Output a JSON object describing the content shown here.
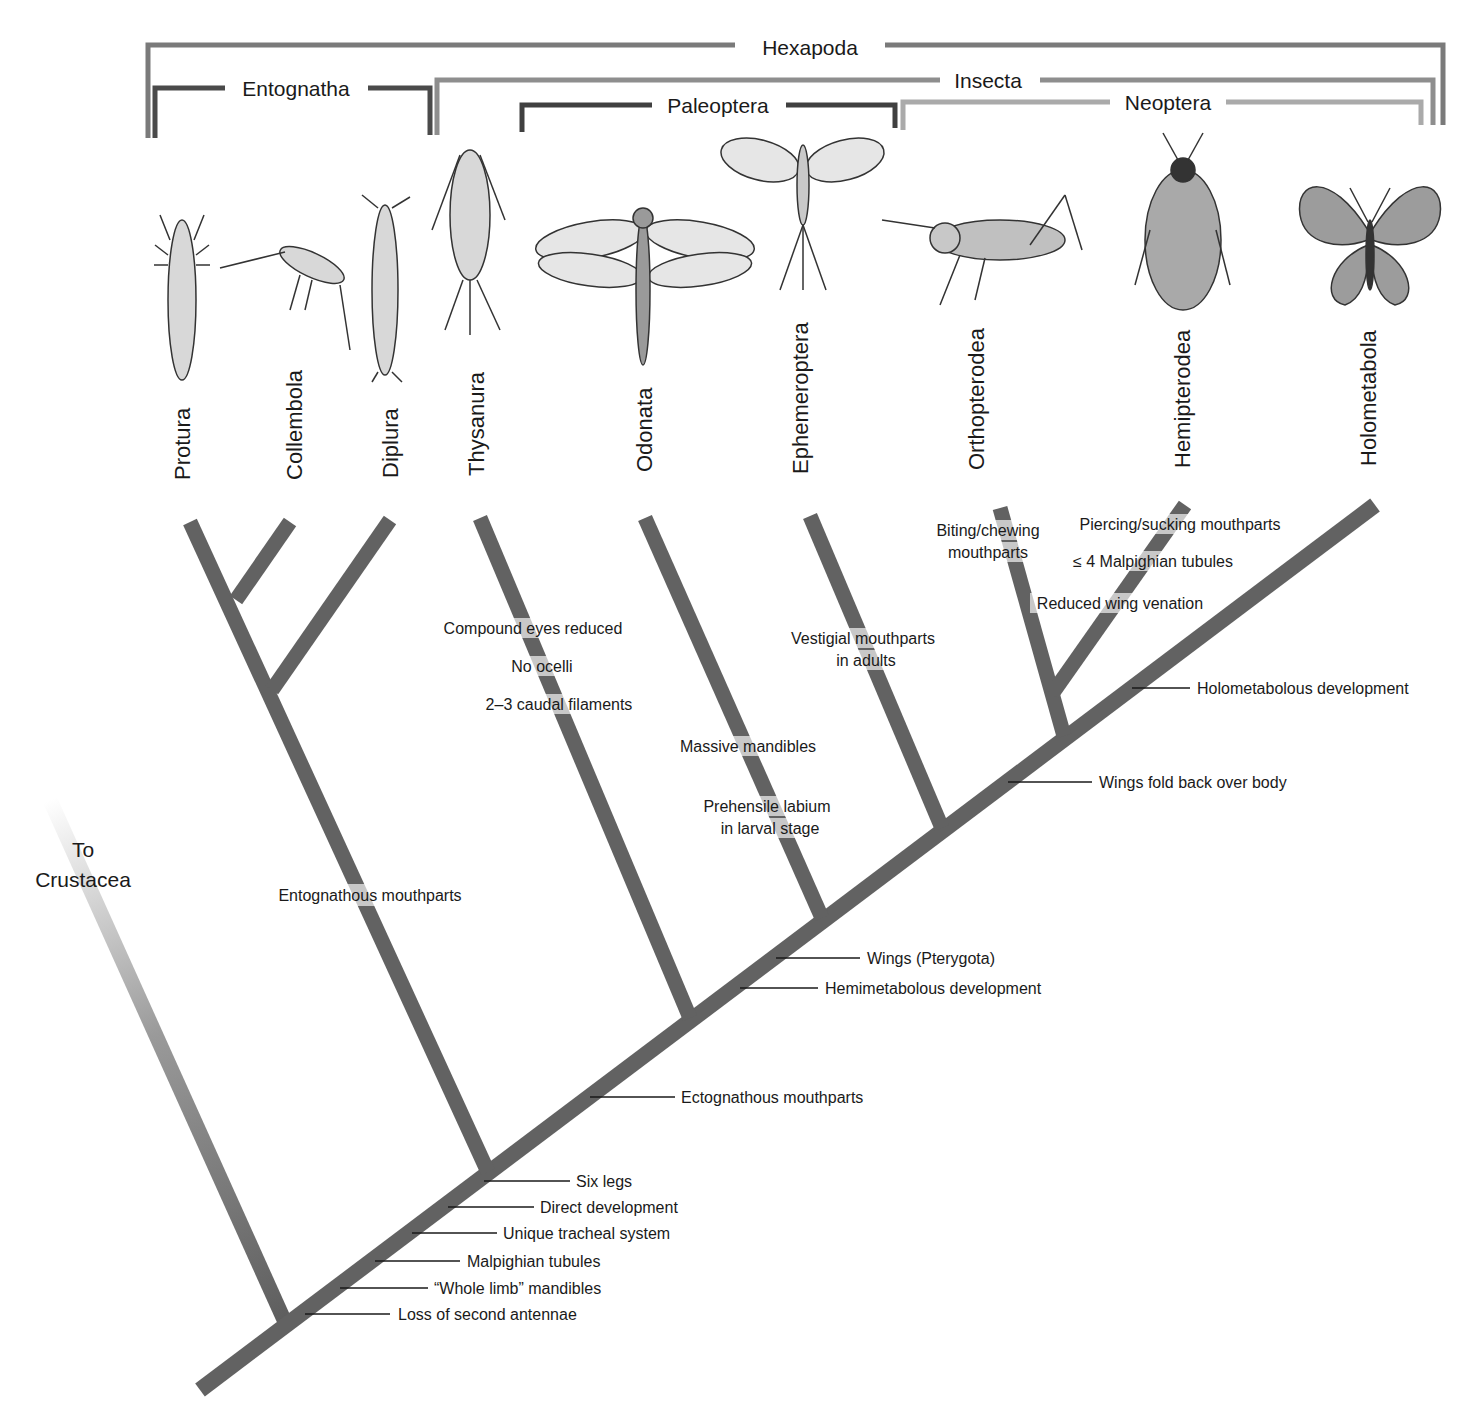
{
  "colors": {
    "branch": "#626262",
    "bracket_dark": "#4a4a4a",
    "bracket_mid": "#7a7a7a",
    "bracket_light": "#a8a8a8",
    "text": "#1a1a1a",
    "leader": "#1a1a1a"
  },
  "clades": {
    "hexapoda": "Hexapoda",
    "entognatha": "Entognatha",
    "insecta": "Insecta",
    "paleoptera": "Paleoptera",
    "neoptera": "Neoptera"
  },
  "taxa": [
    {
      "name": "Protura",
      "icon": "proturan-illustration"
    },
    {
      "name": "Collembola",
      "icon": "springtail-illustration"
    },
    {
      "name": "Diplura",
      "icon": "dipluran-illustration"
    },
    {
      "name": "Thysanura",
      "icon": "silverfish-illustration"
    },
    {
      "name": "Odonata",
      "icon": "dragonfly-illustration"
    },
    {
      "name": "Ephemeroptera",
      "icon": "mayfly-illustration"
    },
    {
      "name": "Orthopterodea",
      "icon": "grasshopper-illustration"
    },
    {
      "name": "Hemipterodea",
      "icon": "true-bug-illustration"
    },
    {
      "name": "Holometabola",
      "icon": "butterfly-illustration"
    }
  ],
  "outgroup": {
    "line1": "To",
    "line2": "Crustacea"
  },
  "branch_traits": {
    "entognathous": "Entognathous mouthparts",
    "thysanura": [
      "Compound eyes reduced",
      "No ocelli",
      "2–3 caudal filaments"
    ],
    "odonata": [
      "Massive mandibles",
      "Prehensile labium",
      "in larval stage"
    ],
    "ephemeroptera": [
      "Vestigial mouthparts",
      "in adults"
    ],
    "orthopterodea": [
      "Biting/chewing",
      "mouthparts"
    ],
    "hemipterodea": [
      "Piercing/sucking mouthparts",
      "≤ 4 Malpighian tubules",
      "Reduced wing venation"
    ]
  },
  "trunk_traits": [
    {
      "label": "Loss of second antennae"
    },
    {
      "label": "“Whole limb” mandibles"
    },
    {
      "label": "Malpighian tubules"
    },
    {
      "label": "Unique tracheal system"
    },
    {
      "label": "Direct development"
    },
    {
      "label": "Six legs"
    },
    {
      "label": "Ectognathous mouthparts"
    },
    {
      "label": "Hemimetabolous development"
    },
    {
      "label": "Wings (Pterygota)"
    },
    {
      "label": "Wings fold back over body"
    },
    {
      "label": "Holometabolous development"
    }
  ]
}
